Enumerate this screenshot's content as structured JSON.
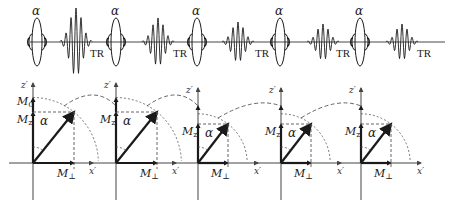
{
  "figure": {
    "colors": {
      "ink": "#1a1a1a",
      "axis": "#444444",
      "dash": "#555555"
    },
    "pulse_sequence": {
      "rf_pulse_label": "α",
      "repetition_label": "TR",
      "rf_pulses": [
        {
          "x": 37,
          "label": "α"
        },
        {
          "x": 116,
          "label": "α"
        },
        {
          "x": 197,
          "label": "α"
        },
        {
          "x": 280,
          "label": "α"
        },
        {
          "x": 360,
          "label": "α"
        }
      ],
      "echoes": [
        {
          "x": 76,
          "amp": 34,
          "tr_x": 90
        },
        {
          "x": 158,
          "amp": 24,
          "tr_x": 173
        },
        {
          "x": 238,
          "amp": 20,
          "tr_x": 255
        },
        {
          "x": 323,
          "amp": 18,
          "tr_x": 336
        },
        {
          "x": 402,
          "amp": 18,
          "tr_x": 417
        }
      ],
      "baseline_y": 42
    },
    "vector_panels": {
      "z_axis_label": "z′",
      "x_axis_label": "x′",
      "angle_label": "α",
      "mz_label": "M",
      "mz_sub": "z",
      "mperp_label": "M",
      "mperp_sub": "⊥",
      "m0_label": "M",
      "m0_sub": "0",
      "origin_y": 163,
      "panels": [
        {
          "ox": 33,
          "top": 83,
          "mz": 30,
          "mx": 41,
          "m0": 60,
          "show_m0": true
        },
        {
          "ox": 116,
          "top": 83,
          "mz": 30,
          "mx": 41,
          "m0": 60,
          "show_m0": false
        },
        {
          "ox": 198,
          "top": 88,
          "mz": 25,
          "mx": 30,
          "m0": 50,
          "show_m0": false
        },
        {
          "ox": 281,
          "top": 88,
          "mz": 25,
          "mx": 30,
          "m0": 50,
          "show_m0": false
        },
        {
          "ox": 361,
          "top": 88,
          "mz": 25,
          "mx": 30,
          "m0": 50,
          "show_m0": false
        }
      ]
    }
  }
}
